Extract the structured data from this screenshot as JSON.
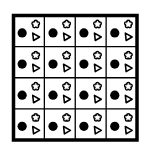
{
  "puzzle": {
    "rows": 4,
    "cols": 4,
    "colors": {
      "ink": "#000000",
      "paper": "#ffffff"
    },
    "cells": [
      [
        {
          "shapes": [
            "circle",
            "flower",
            "triangle"
          ]
        },
        {
          "shapes": [
            "circle",
            "flower",
            "triangle"
          ]
        },
        {
          "shapes": [
            "circle",
            "flower",
            "triangle"
          ]
        },
        {
          "shapes": [
            "circle",
            "flower",
            "triangle"
          ]
        }
      ],
      [
        {
          "shapes": [
            "circle",
            "flower",
            "triangle"
          ]
        },
        {
          "shapes": [
            "circle",
            "flower",
            "triangle"
          ]
        },
        {
          "shapes": [
            "circle",
            "flower",
            "triangle"
          ]
        },
        {
          "shapes": [
            "circle",
            "flower",
            "triangle"
          ]
        }
      ],
      [
        {
          "shapes": [
            "circle",
            "flower",
            "triangle"
          ]
        },
        {
          "shapes": [
            "circle",
            "flower",
            "triangle"
          ]
        },
        {
          "shapes": [
            "circle",
            "flower",
            "triangle"
          ]
        },
        {
          "shapes": [
            "circle",
            "flower",
            "triangle"
          ]
        }
      ],
      [
        {
          "shapes": [
            "circle",
            "flower",
            "triangle"
          ]
        },
        {
          "shapes": [
            "circle",
            "flower",
            "triangle"
          ]
        },
        {
          "shapes": [
            "circle",
            "flower",
            "triangle"
          ]
        },
        {
          "shapes": [
            "circle",
            "flower",
            "triangle"
          ]
        }
      ]
    ]
  }
}
